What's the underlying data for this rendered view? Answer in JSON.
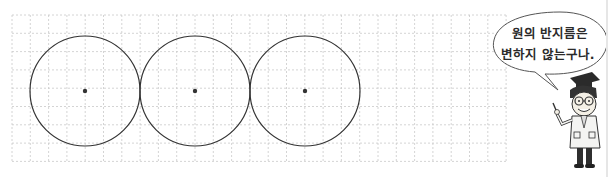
{
  "grid": {
    "x": 12,
    "y": 15,
    "cols": 27,
    "rows": 8,
    "cell": 18.3,
    "line_color": "#c9c9c9"
  },
  "circles": [
    {
      "cx": 85,
      "cy": 91,
      "r": 55,
      "label": "circle-1"
    },
    {
      "cx": 195,
      "cy": 91,
      "r": 55,
      "label": "circle-2"
    },
    {
      "cx": 305,
      "cy": 91,
      "r": 55,
      "label": "circle-3"
    }
  ],
  "colors": {
    "stroke": "#333333",
    "center_dot": "#333333"
  },
  "speech_bubble": {
    "line1": "원의 반지름은",
    "line2": "변하지 않는구나."
  },
  "character": {
    "name": "professor-character"
  }
}
